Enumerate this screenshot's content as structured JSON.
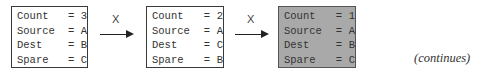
{
  "states": [
    {
      "shaded": false,
      "rows": [
        {
          "key": "Count",
          "eq": "=",
          "val": "3"
        },
        {
          "key": "Source",
          "eq": "=",
          "val": "A"
        },
        {
          "key": "Dest",
          "eq": "=",
          "val": "B"
        },
        {
          "key": "Spare",
          "eq": "=",
          "val": "C"
        }
      ]
    },
    {
      "shaded": false,
      "rows": [
        {
          "key": "Count",
          "eq": "=",
          "val": "2"
        },
        {
          "key": "Source",
          "eq": "=",
          "val": "A"
        },
        {
          "key": "Dest",
          "eq": "=",
          "val": "C"
        },
        {
          "key": "Spare",
          "eq": "=",
          "val": "B"
        }
      ]
    },
    {
      "shaded": true,
      "rows": [
        {
          "key": "Count",
          "eq": "=",
          "val": "1"
        },
        {
          "key": "Source",
          "eq": "=",
          "val": "A"
        },
        {
          "key": "Dest",
          "eq": "=",
          "val": "B"
        },
        {
          "key": "Spare",
          "eq": "=",
          "val": "C"
        }
      ]
    }
  ],
  "transitions": [
    {
      "label": "X"
    },
    {
      "label": "X"
    }
  ],
  "footer": {
    "continues": "(continues)"
  },
  "colors": {
    "shaded_fill": "#a9a9a9",
    "border": "#3a3a3a"
  }
}
